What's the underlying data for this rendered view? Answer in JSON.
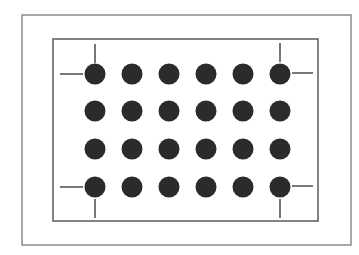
{
  "diagram": {
    "colors": {
      "background": "#ffffff",
      "frame_stroke": "#7a7a7a",
      "inner_frame_stroke": "#5a5a5a",
      "dot_fill": "#2b2b2b",
      "mark_stroke": "#4a4a4a"
    },
    "outer_frame": {
      "x": 22,
      "y": 15,
      "width": 329,
      "height": 230
    },
    "inner_frame": {
      "x": 53,
      "y": 39,
      "width": 265,
      "height": 182
    },
    "grid": {
      "columns": 6,
      "rows": 4,
      "column_centers": [
        95,
        132,
        169,
        206,
        243,
        280
      ],
      "row_centers": [
        74,
        111,
        149,
        187
      ],
      "dot_radius": 10.5
    },
    "corner_marks": [
      {
        "corner": "top-left",
        "h": [
          60,
          74,
          83,
          74
        ],
        "v": [
          95,
          44,
          95,
          63
        ]
      },
      {
        "corner": "top-right",
        "h": [
          292,
          73,
          313,
          73
        ],
        "v": [
          280,
          43,
          280,
          62
        ]
      },
      {
        "corner": "bottom-left",
        "h": [
          60,
          187,
          83,
          187
        ],
        "v": [
          95,
          199,
          95,
          218
        ]
      },
      {
        "corner": "bottom-right",
        "h": [
          292,
          186,
          313,
          186
        ],
        "v": [
          280,
          199,
          280,
          218
        ]
      }
    ]
  }
}
